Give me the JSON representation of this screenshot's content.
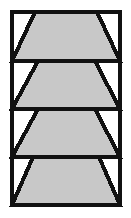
{
  "figure": {
    "title": "Stacked trapezoid bands diagram",
    "canvas": {
      "width": 131,
      "height": 218,
      "background_color": "#ffffff"
    },
    "colors": {
      "outline": "#111111",
      "fill_gray": "#c8c8c8",
      "band_background": "#ffffff",
      "divider": "#111111"
    },
    "frame": {
      "x": 12,
      "y": 12,
      "width": 108,
      "height": 193,
      "stroke_width": 4
    },
    "band_count": 4,
    "divider_y": [
      61,
      109,
      157
    ],
    "divider_stroke_width": 4,
    "bands": [
      {
        "index": 1,
        "name": "band-1",
        "label": "Band 1",
        "top": 12,
        "bottom": 61,
        "top_edge_x1": 35,
        "top_edge_x2": 97,
        "bottom_edge_x1": 12,
        "bottom_edge_x2": 120,
        "fill": "#c8c8c8"
      },
      {
        "index": 2,
        "name": "band-2",
        "label": "Band 2",
        "top": 61,
        "bottom": 109,
        "top_edge_x1": 38,
        "top_edge_x2": 95,
        "bottom_edge_x1": 12,
        "bottom_edge_x2": 120,
        "fill": "#c8c8c8"
      },
      {
        "index": 3,
        "name": "band-3",
        "label": "Band 3",
        "top": 109,
        "bottom": 157,
        "top_edge_x1": 38,
        "top_edge_x2": 95,
        "bottom_edge_x1": 12,
        "bottom_edge_x2": 120,
        "fill": "#c8c8c8"
      },
      {
        "index": 4,
        "name": "band-4",
        "label": "Band 4",
        "top": 157,
        "bottom": 205,
        "top_edge_x1": 33,
        "top_edge_x2": 99,
        "bottom_edge_x1": 12,
        "bottom_edge_x2": 120,
        "fill": "#c8c8c8"
      }
    ]
  }
}
